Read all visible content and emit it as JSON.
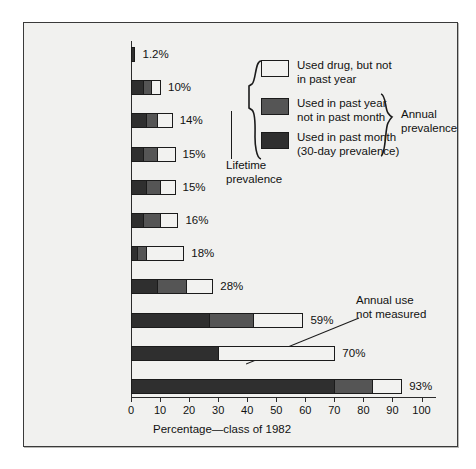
{
  "chart_data": {
    "type": "bar",
    "orientation": "horizontal",
    "stacked": true,
    "title": "",
    "xlabel": "Percentage—class of 1982",
    "ylabel": "",
    "xlim": [
      0,
      100
    ],
    "xticks": [
      0,
      10,
      20,
      30,
      40,
      50,
      60,
      70,
      80,
      90,
      100
    ],
    "grid": false,
    "legend_position": "upper-right-inside",
    "categories": [
      "Heroin",
      "Other opiates",
      "Tranquilizers",
      "Hallucinogens",
      "Sedatives",
      "Cocaine",
      "Inhalants",
      "Stimulants",
      "Marijuana",
      "Cigarettes",
      "Alcohol"
    ],
    "series": [
      {
        "name": "Used in past month (30-day prevalence)",
        "key": "month",
        "color": "#2f2f2f",
        "values": [
          1.2,
          4,
          5,
          4,
          5,
          4,
          2,
          9,
          27,
          30,
          70
        ]
      },
      {
        "name": "Used in past year not in past month",
        "key": "year",
        "color": "#555555",
        "values": [
          0,
          3,
          4,
          5,
          5,
          6,
          3,
          10,
          15,
          0,
          13
        ]
      },
      {
        "name": "Used drug, but not in past year",
        "key": "lifetime",
        "color": "#f2f2f0",
        "values": [
          0,
          3,
          5,
          6,
          5,
          6,
          13,
          9,
          17,
          40,
          10
        ]
      }
    ],
    "totals": [
      1.2,
      10,
      14,
      15,
      15,
      16,
      18,
      28,
      59,
      70,
      93
    ],
    "value_labels": [
      "1.2%",
      "10%",
      "14%",
      "15%",
      "15%",
      "16%",
      "18%",
      "28%",
      "59%",
      "70%",
      "93%"
    ],
    "annotations": [
      {
        "text_line1": "Annual use",
        "text_line2": "not measured",
        "points_to": "Cigarettes"
      }
    ]
  },
  "legend": {
    "items": [
      {
        "swatch": "white",
        "line1": "Used drug, but not",
        "line2": "in past year"
      },
      {
        "swatch": "medium",
        "line1": "Used in past year",
        "line2": "not in past month"
      },
      {
        "swatch": "dark",
        "line1": "Used in past month",
        "line2": "(30-day prevalence)"
      }
    ],
    "brace_right_label_line1": "Annual",
    "brace_right_label_line2": "prevalence",
    "brace_left_label_line1": "Lifetime",
    "brace_left_label_line2": "prevalence"
  },
  "colors": {
    "past_month": "#2f2f2f",
    "past_year": "#555555",
    "lifetime_only": "#f2f2f0",
    "outline": "#1b1b1b",
    "panel_background": "#f1f1ef",
    "page_background": "#ffffff"
  }
}
